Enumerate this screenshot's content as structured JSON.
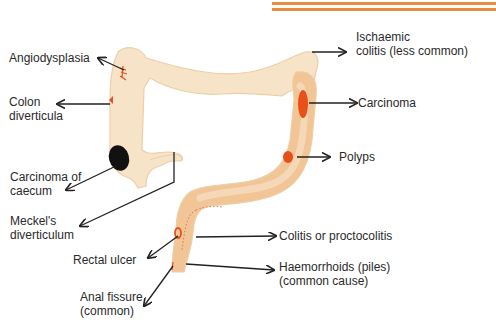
{
  "diagram": {
    "title": "",
    "colors": {
      "colon_fill": "#f7e3c8",
      "colon_outline": "#eccfa9",
      "inflamed_fill": "#f1c595",
      "lesion_red": "#e8501a",
      "carcinoma_caecum": "#111111",
      "header_lines": "#ec8c3a",
      "arrow": "#222222",
      "text": "#2a2a2a"
    },
    "labels": {
      "angiodysplasia": {
        "lines": [
          "Angiodysplasia"
        ]
      },
      "colon_diverticula": {
        "lines": [
          "Colon",
          "diverticula"
        ]
      },
      "carcinoma_of_caecum": {
        "lines": [
          "Carcinoma of",
          "caecum"
        ]
      },
      "meckels_diverticulum": {
        "lines": [
          "Meckel's",
          "diverticulum"
        ]
      },
      "rectal_ulcer": {
        "lines": [
          "Rectal ulcer"
        ]
      },
      "anal_fissure": {
        "lines": [
          "Anal fissure",
          "(common)"
        ]
      },
      "ischaemic_colitis": {
        "lines": [
          "Ischaemic",
          "colitis (less common)"
        ]
      },
      "carcinoma": {
        "lines": [
          "Carcinoma"
        ]
      },
      "polyps": {
        "lines": [
          "Polyps"
        ]
      },
      "colitis_proctocolitis": {
        "lines": [
          "Colitis or proctocolitis"
        ]
      },
      "haemorrhoids": {
        "lines": [
          "Haemorrhoids (piles)",
          "(common cause)"
        ]
      }
    }
  }
}
